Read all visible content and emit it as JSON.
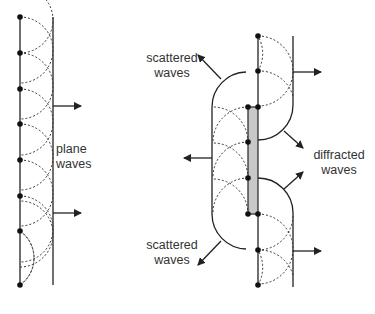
{
  "diagram": {
    "colors": {
      "line": "#222222",
      "aperture_fill": "#c8c8c8",
      "text": "#333333"
    },
    "left_panel": {
      "title": "plane wavefront propagation (Huygens)",
      "label_line1": "plane",
      "label_line2": "waves",
      "source_count": 8
    },
    "right_panel": {
      "scattered_top_line1": "scattered",
      "scattered_top_line2": "waves",
      "diffracted_line1": "diffracted",
      "diffracted_line2": "waves",
      "scattered_bottom_line1": "scattered",
      "scattered_bottom_line2": "waves"
    }
  }
}
